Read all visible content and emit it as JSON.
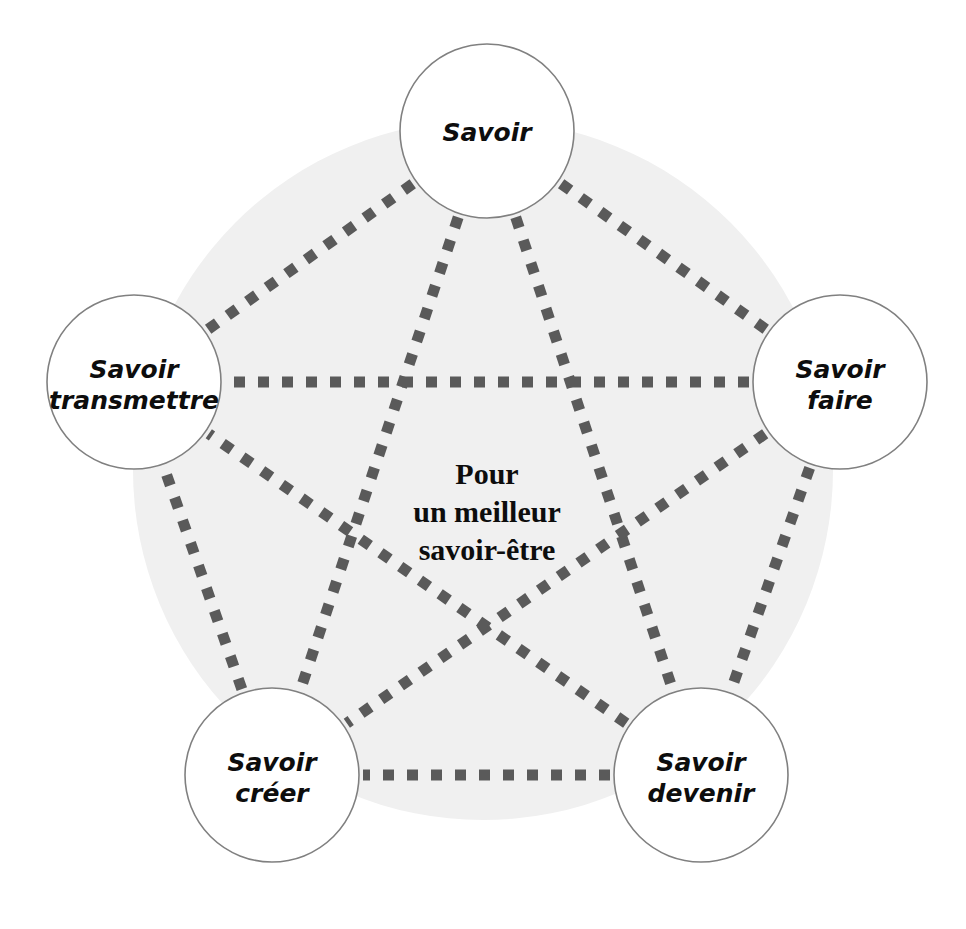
{
  "diagram": {
    "title": "Pour un meilleur savoir-être",
    "type": "pentagon-network",
    "colors": {
      "background": "#ffffff",
      "backdrop_circle": "#f0f0f0",
      "node_fill": "#ffffff",
      "node_stroke": "#808080",
      "dash": "#5a5a5a",
      "text": "#0d0d0d"
    },
    "center": {
      "line1": "Pour",
      "line2": "un meilleur",
      "line3": "savoir-être"
    },
    "nodes": [
      {
        "id": "savoir",
        "line1": "Savoir",
        "line2": "",
        "cx": 487,
        "cy": 131,
        "r": 87
      },
      {
        "id": "savoir-faire",
        "line1": "Savoir",
        "line2": "faire",
        "cx": 840,
        "cy": 382,
        "r": 87
      },
      {
        "id": "savoir-devenir",
        "line1": "Savoir",
        "line2": "devenir",
        "cx": 701,
        "cy": 775,
        "r": 87
      },
      {
        "id": "savoir-creer",
        "line1": "Savoir",
        "line2": "créer",
        "cx": 272,
        "cy": 775,
        "r": 87
      },
      {
        "id": "savoir-transmettre",
        "line1": "Savoir",
        "line2": "transmettre",
        "cx": 134,
        "cy": 382,
        "r": 87
      }
    ],
    "backdrop": {
      "cx": 483,
      "cy": 470,
      "r": 350
    },
    "edges": [
      {
        "from": "savoir",
        "to": "savoir-faire"
      },
      {
        "from": "savoir-faire",
        "to": "savoir-devenir"
      },
      {
        "from": "savoir-devenir",
        "to": "savoir-creer"
      },
      {
        "from": "savoir-creer",
        "to": "savoir-transmettre"
      },
      {
        "from": "savoir-transmettre",
        "to": "savoir"
      },
      {
        "from": "savoir",
        "to": "savoir-devenir"
      },
      {
        "from": "savoir",
        "to": "savoir-creer"
      },
      {
        "from": "savoir-faire",
        "to": "savoir-creer"
      },
      {
        "from": "savoir-faire",
        "to": "savoir-transmettre"
      },
      {
        "from": "savoir-devenir",
        "to": "savoir-transmettre"
      }
    ]
  },
  "chart_data": {
    "type": "diagram",
    "title": "Pour un meilleur savoir-être",
    "categories": [
      "Savoir",
      "Savoir faire",
      "Savoir devenir",
      "Savoir créer",
      "Savoir transmettre"
    ],
    "edge_count": 10,
    "node_count": 5,
    "legend": []
  }
}
